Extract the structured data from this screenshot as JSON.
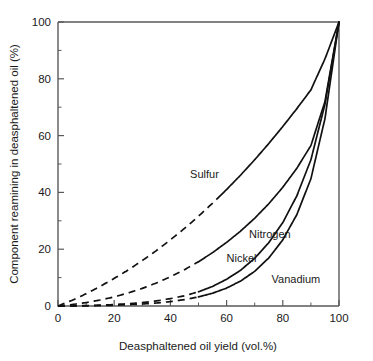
{
  "chart_data": {
    "type": "line",
    "title": "",
    "xlabel": "Deasphaltened oil yield (vol.%)",
    "ylabel": "Component reamining in deasphaltened oil (%)",
    "xlim": [
      0,
      100
    ],
    "ylim": [
      0,
      100
    ],
    "grid": false,
    "legend_position": "inline-curve-labels",
    "xticks": [
      0,
      20,
      40,
      60,
      80,
      100
    ],
    "xticklabels": [
      "0",
      "20",
      "40",
      "60",
      "80",
      "100"
    ],
    "xminorticks": [
      10,
      30,
      50,
      70,
      90
    ],
    "yticks": [
      0,
      20,
      40,
      60,
      80,
      100
    ],
    "yticklabels": [
      "0",
      "20",
      "40",
      "60",
      "80",
      "100"
    ],
    "yminorticks": [
      10,
      30,
      50,
      70,
      90
    ],
    "x": [
      0,
      5,
      10,
      15,
      20,
      25,
      30,
      35,
      40,
      45,
      50,
      55,
      60,
      65,
      70,
      75,
      80,
      85,
      90,
      95,
      100
    ],
    "series": [
      {
        "name": "Sulfur",
        "label": "Sulfur",
        "dash_until_x": 57,
        "label_x": 47,
        "label_y": 45,
        "values": [
          0,
          2.0,
          4.3,
          6.9,
          9.7,
          12.7,
          16.0,
          19.5,
          23.3,
          27.3,
          31.6,
          36.2,
          41.0,
          46.1,
          51.5,
          57.2,
          63.2,
          69.5,
          76.1,
          87.0,
          100
        ]
      },
      {
        "name": "Nitrogen",
        "label": "Nitrogen",
        "dash_until_x": 50,
        "label_x": 68,
        "label_y": 24,
        "values": [
          0,
          0.5,
          1.2,
          2.1,
          3.2,
          4.6,
          6.2,
          8.1,
          10.3,
          12.8,
          15.6,
          18.8,
          22.4,
          26.4,
          30.9,
          36.0,
          41.8,
          48.5,
          56.5,
          72.0,
          100
        ]
      },
      {
        "name": "Nickel",
        "label": "Nickel",
        "dash_until_x": 50,
        "label_x": 60,
        "label_y": 15.5,
        "values": [
          0,
          0.05,
          0.15,
          0.3,
          0.5,
          0.8,
          1.2,
          1.8,
          2.6,
          3.6,
          5.0,
          6.9,
          9.4,
          12.6,
          16.8,
          22.3,
          29.4,
          38.8,
          51.5,
          71.0,
          100
        ]
      },
      {
        "name": "Vanadium",
        "label": "Vanadium",
        "dash_until_x": 50,
        "label_x": 76,
        "label_y": 8,
        "values": [
          0,
          0.02,
          0.07,
          0.15,
          0.27,
          0.45,
          0.7,
          1.05,
          1.55,
          2.25,
          3.2,
          4.5,
          6.3,
          8.8,
          12.2,
          16.9,
          23.3,
          32.2,
          44.8,
          66.0,
          100
        ]
      }
    ]
  }
}
